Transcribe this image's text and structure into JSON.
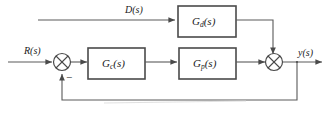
{
  "diagram": {
    "line_color": "#5a5a5a",
    "block_border_color": "#4a4a4a",
    "text_color": "#1a1a1a",
    "background": "#ffffff",
    "blocks": [
      {
        "id": "gd",
        "label_base": "G",
        "label_sub": "d",
        "label_tail": "(s)",
        "label_full": "Gd(s)"
      },
      {
        "id": "gc",
        "label_base": "G",
        "label_sub": "c",
        "label_tail": "(s)",
        "label_full": "Gc(s)"
      },
      {
        "id": "gp",
        "label_base": "G",
        "label_sub": "p",
        "label_tail": "(s)",
        "label_full": "Gp(s)"
      }
    ],
    "signals": [
      {
        "id": "reference_input",
        "label": "R(s)"
      },
      {
        "id": "disturbance_input",
        "label": "D(s)"
      },
      {
        "id": "output",
        "label": "y(s)"
      }
    ],
    "junctions": [
      {
        "id": "error-summing-junction",
        "sign": "−"
      },
      {
        "id": "output-summing-junction",
        "sign": ""
      }
    ],
    "caption_text": ""
  }
}
